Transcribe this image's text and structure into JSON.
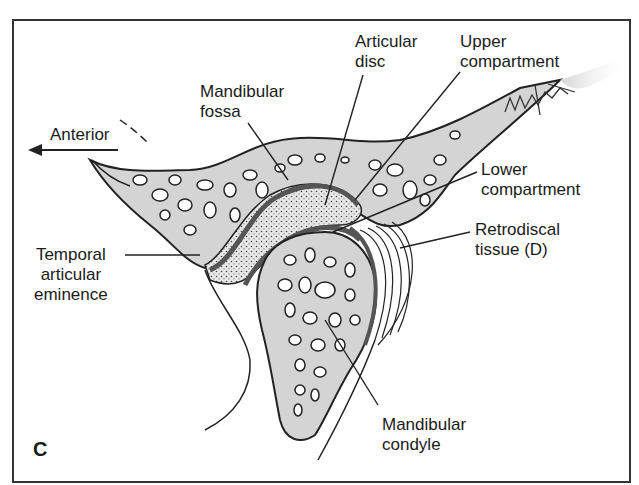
{
  "figure": {
    "panel_letter": "C",
    "signature": "BMISTC"
  },
  "labels": {
    "anterior": "Anterior",
    "mandibular_fossa": "Mandibular\nfossa",
    "articular_disc": "Articular\ndisc",
    "upper_compartment": "Upper\ncompartment",
    "lower_compartment": "Lower\ncompartment",
    "retrodiscal_tissue": "Retrodiscal\ntissue (D)",
    "temporal_articular_eminence": "Temporal\narticular\neminence",
    "mandibular_condyle": "Mandibular\ncondyle"
  },
  "colors": {
    "bone_fill": "#d4d4d4",
    "outline": "#222222",
    "disc_dark": "#555555",
    "frame": "#333333",
    "background": "#ffffff"
  }
}
